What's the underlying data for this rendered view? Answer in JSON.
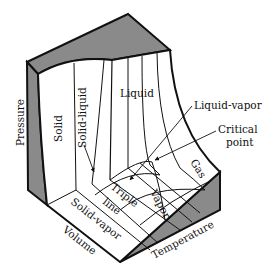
{
  "diagram": {
    "axes": {
      "pressure": "Pressure",
      "volume": "Volume",
      "temperature": "Temperature"
    },
    "regions": {
      "solid": "Solid",
      "solid_liquid": "Solid-liquid",
      "liquid": "Liquid",
      "gas": "Gas",
      "vapor": "Vapor",
      "solid_vapor": "Solid-vapor",
      "triple_line_1": "Triple",
      "triple_line_2": "line"
    },
    "annotations": {
      "liquid_vapor": "Liquid-vapor",
      "critical_point_1": "Critical",
      "critical_point_2": "point"
    },
    "colors": {
      "shaded_face": "#8a8a8a",
      "outline": "#111111",
      "surface": "#ffffff"
    }
  }
}
